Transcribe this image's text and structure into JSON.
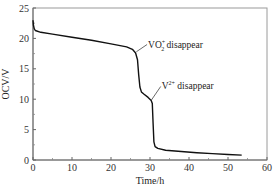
{
  "chart_data": {
    "type": "line",
    "title": "",
    "xlabel": "Time/h",
    "ylabel": "OCV/V",
    "xlim": [
      0,
      60
    ],
    "ylim": [
      0,
      25
    ],
    "xticks": [
      0,
      10,
      20,
      30,
      40,
      50,
      60
    ],
    "yticks": [
      0,
      5,
      10,
      15,
      20,
      25
    ],
    "grid": false,
    "legend": null,
    "series": [
      {
        "name": "OCV",
        "color": "#111111",
        "x": [
          0,
          0.1,
          0.3,
          0.6,
          2,
          5,
          10,
          15,
          20,
          24,
          25.5,
          26.3,
          26.8,
          27.1,
          27.4,
          27.8,
          28.5,
          29.5,
          30.3,
          30.6,
          30.8,
          31.0,
          31.3,
          32,
          34,
          38,
          42,
          46,
          50,
          53.5
        ],
        "y": [
          23.0,
          22.2,
          21.6,
          21.3,
          21.0,
          20.7,
          20.2,
          19.7,
          19.1,
          18.6,
          18.2,
          17.6,
          16.5,
          14.0,
          12.0,
          11.2,
          10.8,
          10.3,
          9.8,
          9.3,
          6.0,
          3.0,
          2.2,
          1.9,
          1.6,
          1.4,
          1.2,
          1.05,
          0.9,
          0.8
        ]
      }
    ],
    "annotations": [
      {
        "text_main": "VO",
        "sub": "2",
        "sup": "+",
        "text_rest": " disappear",
        "point": [
          26.5,
          17.8
        ],
        "label_pos": [
          29.5,
          18.5
        ]
      },
      {
        "text_main": "V",
        "sup": "2+",
        "text_rest": " disappear",
        "point": [
          30.3,
          9.8
        ],
        "label_pos": [
          33.0,
          11.6
        ]
      }
    ]
  }
}
